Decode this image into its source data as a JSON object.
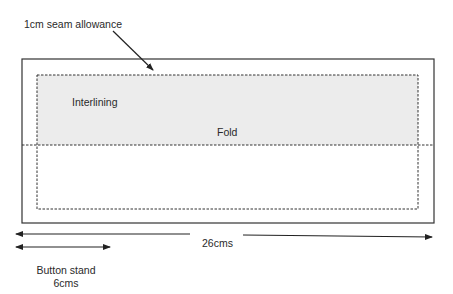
{
  "labels": {
    "seam_allowance": "1cm seam allowance",
    "interlining": "Interlining",
    "fold": "Fold",
    "total_width": "26cms",
    "button_stand_line1": "Button stand",
    "button_stand_line2": "6cms"
  },
  "colors": {
    "interlining_fill": "#ececec",
    "line": "#222222",
    "background": "#ffffff"
  },
  "measurements": {
    "total_width_cm": 26,
    "button_stand_cm": 6,
    "seam_allowance_cm": 1
  }
}
